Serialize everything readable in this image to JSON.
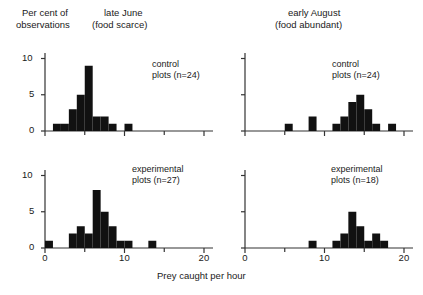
{
  "figure": {
    "y_axis_title_line1": "Per cent of",
    "y_axis_title_line2": "observations",
    "x_axis_title": "Prey caught per hour",
    "column_headings": [
      {
        "line1": "late June",
        "line2": "(food scarce)"
      },
      {
        "line1": "early August",
        "line2": "(food abundant)"
      }
    ],
    "panel_labels": [
      {
        "line1": "control",
        "line2": "plots (n=24)"
      },
      {
        "line1": "control",
        "line2": "plots (n=24)"
      },
      {
        "line1": "experimental",
        "line2": "plots (n=27)"
      },
      {
        "line1": "experimental",
        "line2": "plots (n=18)"
      }
    ],
    "y_ticks": [
      "0",
      "5",
      "10"
    ],
    "x_ticks": [
      "0",
      "10",
      "20"
    ],
    "bar_color": "#111111",
    "axis_color": "#333333"
  },
  "chart_data": [
    {
      "type": "bar",
      "title": "late June (food scarce) — control plots (n=24)",
      "panel": "top-left",
      "xlabel": "Prey caught per hour",
      "ylabel": "Per cent of observations",
      "xlim": [
        0,
        21
      ],
      "ylim": [
        0,
        11.5
      ],
      "xticks": [
        0,
        10,
        20
      ],
      "xminorticks": [
        5,
        15
      ],
      "yticks": [
        0,
        5,
        10
      ],
      "grid": false,
      "legend": "control plots (n=24)",
      "bin_width": 1,
      "bin_starts": [
        1,
        2,
        3,
        4,
        5,
        6,
        7,
        8,
        9,
        10
      ],
      "values": [
        1,
        1,
        3,
        5,
        9,
        2,
        2,
        1,
        0,
        1
      ]
    },
    {
      "type": "bar",
      "title": "early August (food abundant) — control plots (n=24)",
      "panel": "top-right",
      "xlabel": "Prey caught per hour",
      "ylabel": "Per cent of observations",
      "xlim": [
        0,
        21
      ],
      "ylim": [
        0,
        11.5
      ],
      "xticks": [
        0,
        10,
        20
      ],
      "xminorticks": [
        5,
        15
      ],
      "yticks": [
        0,
        5,
        10
      ],
      "grid": false,
      "legend": "control plots (n=24)",
      "bin_width": 1,
      "bin_starts": [
        5,
        8,
        11,
        12,
        13,
        14,
        15,
        16,
        17,
        18
      ],
      "values": [
        1,
        2,
        1,
        2,
        4,
        5,
        3,
        1,
        0,
        1
      ]
    },
    {
      "type": "bar",
      "title": "late June (food scarce) — experimental plots (n=27)",
      "panel": "bottom-left",
      "xlabel": "Prey caught per hour",
      "ylabel": "Per cent of observations",
      "xlim": [
        0,
        21
      ],
      "ylim": [
        0,
        11.5
      ],
      "xticks": [
        0,
        10,
        20
      ],
      "xminorticks": [
        5,
        15
      ],
      "yticks": [
        0,
        5,
        10
      ],
      "grid": false,
      "legend": "experimental plots (n=27)",
      "bin_width": 1,
      "bin_starts": [
        0,
        3,
        4,
        5,
        6,
        7,
        8,
        9,
        10,
        13
      ],
      "values": [
        1,
        2,
        3,
        2,
        8,
        5,
        3,
        1,
        1,
        1
      ]
    },
    {
      "type": "bar",
      "title": "early August (food abundant) — experimental plots (n=18)",
      "panel": "bottom-right",
      "xlabel": "Prey caught per hour",
      "ylabel": "Per cent of observations",
      "xlim": [
        0,
        21
      ],
      "ylim": [
        0,
        11.5
      ],
      "xticks": [
        0,
        10,
        20
      ],
      "xminorticks": [
        5,
        15
      ],
      "yticks": [
        0,
        5,
        10
      ],
      "grid": false,
      "legend": "experimental plots (n=18)",
      "bin_width": 1,
      "bin_starts": [
        8,
        11,
        12,
        13,
        14,
        15,
        16,
        17
      ],
      "values": [
        1,
        1,
        2,
        5,
        3,
        1,
        2,
        1
      ]
    }
  ]
}
